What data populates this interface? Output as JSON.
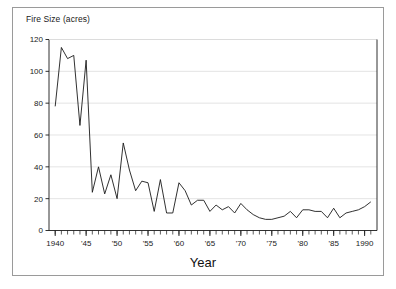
{
  "figure": {
    "background_color": "#ffffff",
    "border_color": "#9a9a9a",
    "line_color": "#1a1a1a",
    "grid_color": "#d9d9d9",
    "axis_color": "#1a1a1a"
  },
  "labels": {
    "ylabel": "Fire Size (acres)",
    "xlabel": "Year"
  },
  "chart_data": {
    "type": "line",
    "title": "",
    "subtitle": "",
    "xlabel": "Year",
    "ylabel": "Fire Size (acres)",
    "xlim": [
      1939,
      1992
    ],
    "ylim": [
      0,
      120
    ],
    "yticks": [
      0,
      20,
      40,
      60,
      80,
      100,
      120
    ],
    "ytick_labels": [
      "0",
      "20",
      "40",
      "60",
      "80",
      "100",
      "120"
    ],
    "xticks": [
      1940,
      1945,
      1950,
      1955,
      1960,
      1965,
      1970,
      1975,
      1980,
      1985,
      1990
    ],
    "xtick_labels": [
      "1940",
      "'45",
      "'50",
      "'55",
      "'60",
      "'65",
      "'70",
      "'75",
      "'80",
      "'85",
      "1990"
    ],
    "minor_xtick_interval": 1,
    "grid": "horizontal",
    "legend": "none",
    "series": [
      {
        "name": "Fire Size",
        "x": [
          1940,
          1941,
          1942,
          1943,
          1944,
          1945,
          1946,
          1947,
          1948,
          1949,
          1950,
          1951,
          1952,
          1953,
          1954,
          1955,
          1956,
          1957,
          1958,
          1959,
          1960,
          1961,
          1962,
          1963,
          1964,
          1965,
          1966,
          1967,
          1968,
          1969,
          1970,
          1971,
          1972,
          1973,
          1974,
          1975,
          1976,
          1977,
          1978,
          1979,
          1980,
          1981,
          1982,
          1983,
          1984,
          1985,
          1986,
          1987,
          1988,
          1989,
          1990,
          1991
        ],
        "values": [
          78,
          115,
          108,
          110,
          66,
          107,
          24,
          40,
          23,
          35,
          20,
          55,
          38,
          25,
          31,
          30,
          12,
          32,
          11,
          11,
          30,
          25,
          16,
          19,
          19,
          12,
          16,
          13,
          15,
          11,
          17,
          13,
          10,
          8,
          7,
          7,
          8,
          9,
          12,
          8,
          13,
          13,
          12,
          12,
          8,
          14,
          8,
          11,
          12,
          13,
          15,
          18
        ]
      }
    ]
  }
}
